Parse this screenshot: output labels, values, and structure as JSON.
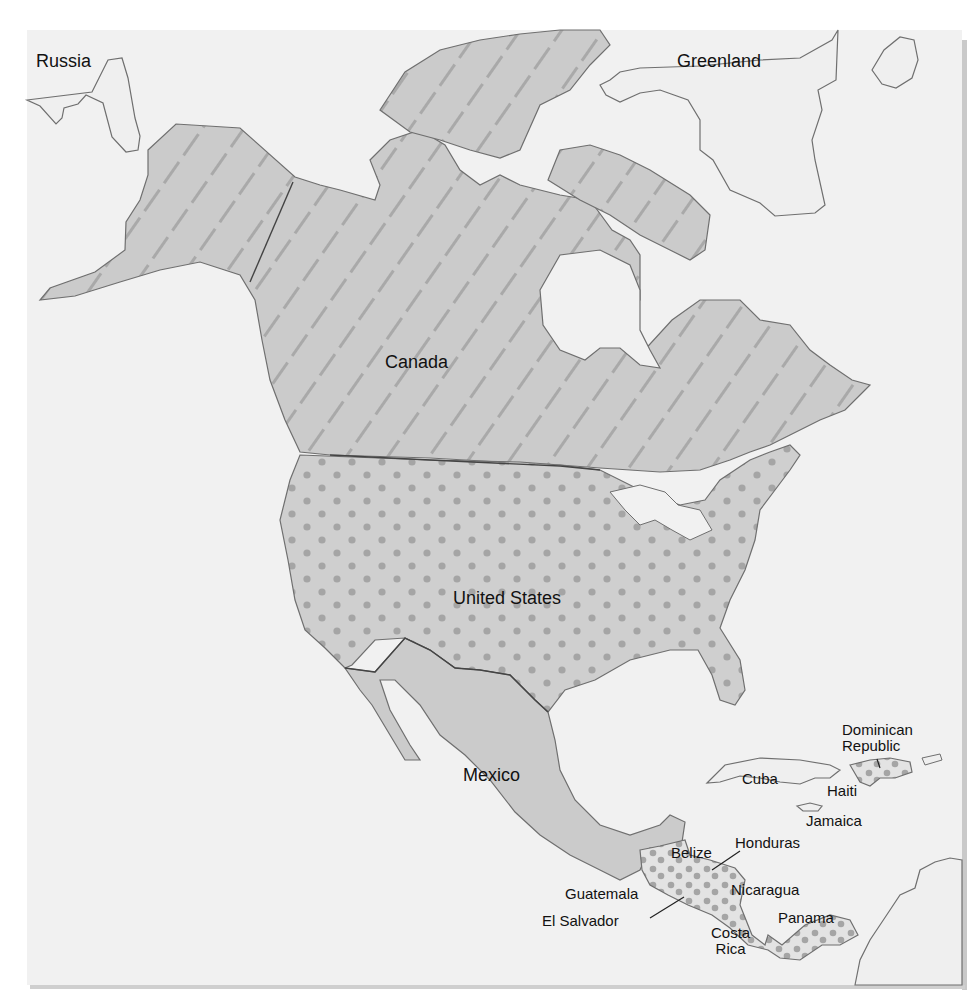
{
  "map": {
    "title": "North America political map",
    "colors": {
      "background": "#ffffff",
      "ocean": "#f1f1f1",
      "land_neutral": "#efefef",
      "land_shaded": "#cbcbcb",
      "hatch_stroke": "#a9a9a9",
      "dot_fill": "#a5a5a5",
      "coast_stroke": "#6f6f6f",
      "border_stroke": "#444444",
      "label": "#111111"
    },
    "legend_patterns": {
      "Canada": "diagonal-hatch",
      "United States": "dots",
      "Mexico": "solid-gray",
      "Central America": "dots",
      "Caribbean": "dots (Hispaniola)"
    },
    "labels": {
      "russia": "Russia",
      "greenland": "Greenland",
      "canada": "Canada",
      "united_states": "United States",
      "mexico": "Mexico",
      "cuba": "Cuba",
      "haiti": "Haiti",
      "dominican_republic": "Dominican\nRepublic",
      "jamaica": "Jamaica",
      "belize": "Belize",
      "honduras": "Honduras",
      "guatemala": "Guatemala",
      "el_salvador": "El Salvador",
      "nicaragua": "Nicaragua",
      "costa_rica": "Costa\nRica",
      "panama": "Panama"
    }
  }
}
